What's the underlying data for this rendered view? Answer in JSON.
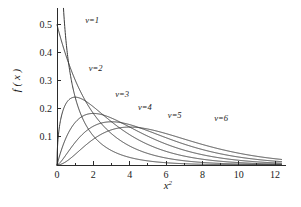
{
  "figure": {
    "name": "chi-square-density-figure",
    "caption": ""
  },
  "chart_data": {
    "type": "line",
    "title": "",
    "subtitle": "",
    "xlabel": "x²",
    "ylabel": "f ( x )",
    "xlim": [
      0,
      12.6
    ],
    "ylim": [
      0,
      0.56
    ],
    "grid": false,
    "legend_position": "inline-curve-labels",
    "xticks": [
      0,
      2,
      4,
      6,
      8,
      10,
      12
    ],
    "xticklabels": [
      "0",
      "2",
      "4",
      "6",
      "8",
      "10",
      "12"
    ],
    "xminorticks": [
      1,
      3,
      5,
      7,
      9,
      11
    ],
    "yticks": [
      0.1,
      0.2,
      0.3,
      0.4,
      0.5
    ],
    "yticklabels": [
      "0.1",
      "0.2",
      "0.3",
      "0.4",
      "0.5"
    ],
    "distribution": "chi-squared probability density",
    "parameter_symbol": "v",
    "series": [
      {
        "name": "v=1",
        "label": "v=1",
        "df": 1,
        "label_x": 1.55,
        "label_y": 0.505,
        "x": [
          0.05,
          0.1,
          0.2,
          0.3,
          0.4,
          0.5,
          0.75,
          1.0,
          1.5,
          2.0,
          2.5,
          3.0,
          4.0,
          5.0,
          6.0,
          8.0,
          10.0,
          12.0
        ],
        "y": [
          1.744,
          1.2,
          0.8022,
          0.6267,
          0.5205,
          0.4394,
          0.3045,
          0.242,
          0.1554,
          0.1037,
          0.0713,
          0.0514,
          0.0269,
          0.0146,
          0.0081,
          0.0026,
          0.0009,
          0.0003
        ]
      },
      {
        "name": "v=2",
        "label": "v=2",
        "df": 2,
        "label_x": 1.75,
        "label_y": 0.335,
        "x": [
          0.0,
          0.5,
          1.0,
          1.5,
          2.0,
          3.0,
          4.0,
          5.0,
          6.0,
          7.0,
          8.0,
          9.0,
          10.0,
          11.0,
          12.0
        ],
        "y": [
          0.5,
          0.3894,
          0.3033,
          0.2362,
          0.1839,
          0.1116,
          0.0677,
          0.041,
          0.0249,
          0.0151,
          0.0092,
          0.0056,
          0.0034,
          0.002,
          0.0012
        ]
      },
      {
        "name": "v=3",
        "label": "v=3",
        "df": 3,
        "label_x": 3.2,
        "label_y": 0.242,
        "x": [
          0.0,
          0.5,
          1.0,
          1.5,
          2.0,
          2.5,
          3.0,
          4.0,
          5.0,
          6.0,
          7.0,
          8.0,
          9.0,
          10.0,
          11.0,
          12.0
        ],
        "y": [
          0.0,
          0.2197,
          0.242,
          0.2207,
          0.187,
          0.1532,
          0.1226,
          0.0764,
          0.0462,
          0.0272,
          0.0157,
          0.009,
          0.0051,
          0.0028,
          0.0016,
          0.0009
        ]
      },
      {
        "name": "v=4",
        "label": "v=4",
        "df": 4,
        "label_x": 4.45,
        "label_y": 0.197,
        "x": [
          0.0,
          0.5,
          1.0,
          1.5,
          2.0,
          2.5,
          3.0,
          4.0,
          5.0,
          6.0,
          7.0,
          8.0,
          9.0,
          10.0,
          11.0,
          12.0
        ],
        "y": [
          0.0,
          0.0974,
          0.1516,
          0.1772,
          0.1839,
          0.1791,
          0.1673,
          0.1353,
          0.1026,
          0.0747,
          0.0528,
          0.0366,
          0.025,
          0.0169,
          0.0113,
          0.0074
        ]
      },
      {
        "name": "v=5",
        "label": "v=5",
        "df": 5,
        "label_x": 6.1,
        "label_y": 0.168,
        "x": [
          0.0,
          0.5,
          1.0,
          1.5,
          2.0,
          3.0,
          4.0,
          5.0,
          6.0,
          7.0,
          8.0,
          9.0,
          10.0,
          11.0,
          12.0
        ],
        "y": [
          0.0,
          0.0366,
          0.0807,
          0.1156,
          0.1383,
          0.1542,
          0.1433,
          0.122,
          0.0977,
          0.0752,
          0.0564,
          0.0414,
          0.0299,
          0.0213,
          0.0151
        ]
      },
      {
        "name": "v=6",
        "label": "v=6",
        "df": 6,
        "label_x": 8.65,
        "label_y": 0.158,
        "x": [
          0.0,
          0.5,
          1.0,
          1.5,
          2.0,
          3.0,
          4.0,
          5.0,
          6.0,
          7.0,
          8.0,
          9.0,
          10.0,
          11.0,
          12.0
        ],
        "y": [
          0.0,
          0.0122,
          0.038,
          0.0664,
          0.092,
          0.1255,
          0.1353,
          0.1283,
          0.112,
          0.0919,
          0.0733,
          0.0564,
          0.0421,
          0.0309,
          0.0223
        ]
      }
    ]
  }
}
